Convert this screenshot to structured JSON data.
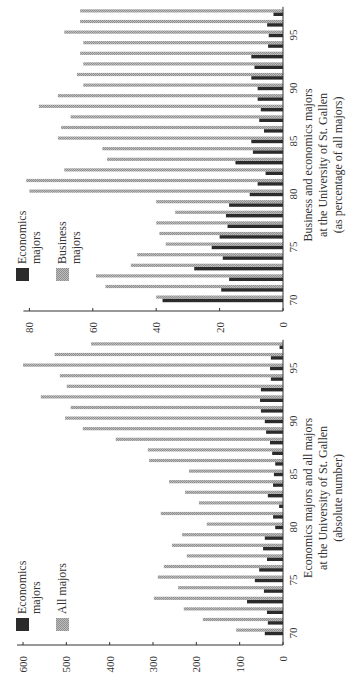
{
  "colors": {
    "economics": "#2b2b2b",
    "secondary": "#a6a6a6",
    "axis": "#333333"
  },
  "chart_data": [
    {
      "type": "bar",
      "orientation": "rotated-90-ccw",
      "title": "",
      "xlabel": "Business and economics majors at the University of St. Gallen (as percentage of all majors)",
      "xlabel_lines": [
        "Business and economics majors",
        "at the University of St. Gallen",
        "(as percentage of all majors)"
      ],
      "ylabel": "",
      "ylim": [
        0,
        80
      ],
      "yticks": [
        0,
        20,
        40,
        60,
        80
      ],
      "xtick_labels": [
        "70",
        "75",
        "80",
        "85",
        "90",
        "95"
      ],
      "grid": false,
      "legend_position": "upper-left (rotated)",
      "categories": [
        70,
        71,
        72,
        73,
        74,
        75,
        76,
        77,
        78,
        79,
        80,
        81,
        82,
        83,
        84,
        85,
        86,
        87,
        88,
        89,
        90,
        91,
        92,
        93,
        94,
        95,
        96,
        97
      ],
      "series": [
        {
          "name": "Economics majors",
          "color": "#2b2b2b",
          "values": [
            38,
            19.5,
            17,
            28,
            19,
            22.5,
            20,
            17.5,
            18,
            17,
            10.5,
            8,
            5.5,
            15,
            9.5,
            10,
            6,
            7.5,
            7,
            8,
            8,
            10,
            9,
            10,
            4.7,
            4.5,
            5,
            3
          ]
        },
        {
          "name": "Business majors",
          "color": "#a6a6a6",
          "values": [
            40,
            56,
            59,
            48,
            46,
            37,
            39,
            40,
            34,
            40,
            80,
            81,
            69,
            55.5,
            57,
            71,
            70,
            67,
            77,
            71,
            63,
            65,
            63,
            64,
            63,
            69,
            64,
            64
          ]
        }
      ],
      "legend": [
        {
          "label_lines": [
            "Economics",
            "majors"
          ],
          "color": "#2b2b2b"
        },
        {
          "label_lines": [
            "Business",
            "majors"
          ],
          "color": "#a6a6a6"
        }
      ]
    },
    {
      "type": "bar",
      "orientation": "rotated-90-ccw",
      "title": "",
      "xlabel": "Economics majors and all majors at the University of St. Gallen (absolute number)",
      "xlabel_lines": [
        "Economics majors and all majors",
        "at the University of St. Gallen",
        "(absolute number)"
      ],
      "ylabel": "",
      "ylim": [
        0,
        600
      ],
      "yticks": [
        0,
        100,
        200,
        300,
        400,
        500,
        600
      ],
      "xtick_labels": [
        "70",
        "75",
        "80",
        "85",
        "90",
        "95"
      ],
      "grid": false,
      "legend_position": "upper-left (rotated)",
      "categories": [
        70,
        71,
        72,
        73,
        74,
        75,
        76,
        77,
        78,
        79,
        80,
        81,
        82,
        83,
        84,
        85,
        86,
        87,
        88,
        89,
        90,
        91,
        92,
        93,
        94,
        95,
        96,
        97
      ],
      "series": [
        {
          "name": "Economics majors",
          "color": "#2b2b2b",
          "values": [
            42,
            35,
            37,
            83,
            44,
            65,
            55,
            37,
            46,
            42,
            18,
            23,
            9,
            35,
            23,
            21,
            18,
            25,
            30,
            39,
            42,
            51,
            53,
            51,
            28,
            30,
            28,
            8
          ]
        },
        {
          "name": "All majors",
          "color": "#a6a6a6",
          "values": [
            108,
            185,
            229,
            298,
            242,
            289,
            275,
            222,
            256,
            233,
            176,
            282,
            194,
            226,
            263,
            217,
            309,
            312,
            386,
            462,
            503,
            490,
            559,
            499,
            515,
            600,
            527,
            443
          ]
        }
      ],
      "legend": [
        {
          "label_lines": [
            "Economics",
            "majors"
          ],
          "color": "#2b2b2b"
        },
        {
          "label_lines": [
            "All majors"
          ],
          "color": "#a6a6a6"
        }
      ]
    }
  ]
}
